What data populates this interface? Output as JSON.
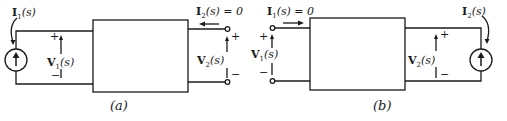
{
  "figures": [
    {
      "caption": "(a)",
      "source_current": {
        "main": "I",
        "sub": "1",
        "arg": "(s)"
      },
      "left_voltage": {
        "main": "V",
        "sub": "1",
        "arg": "(s)"
      },
      "right_current": {
        "main": "I",
        "sub": "2",
        "arg": "(s) = 0"
      },
      "right_voltage": {
        "main": "V",
        "sub": "2",
        "arg": "(s)"
      },
      "plus": "+",
      "minus": "−"
    },
    {
      "caption": "(b)",
      "left_current": {
        "main": "I",
        "sub": "1",
        "arg": "(s) = 0"
      },
      "left_voltage": {
        "main": "V",
        "sub": "1",
        "arg": "(s)"
      },
      "right_voltage": {
        "main": "V",
        "sub": "2",
        "arg": "(s)"
      },
      "source_current": {
        "main": "I",
        "sub": "2",
        "arg": "(s)"
      },
      "plus": "+",
      "minus": "−"
    }
  ],
  "colors": {
    "line": "#1a1a1a",
    "background": "#ffffff"
  }
}
